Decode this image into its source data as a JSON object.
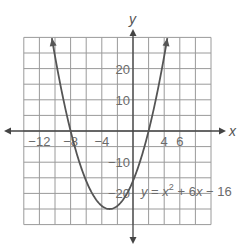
{
  "chart_data": {
    "type": "line",
    "title": "",
    "equation_label": "y = x^2 + 6x - 16",
    "equation_parts": {
      "y": "y",
      "eq": " = ",
      "x": "x",
      "exp": "2",
      "rest1": " + 6",
      "x2": "x",
      "rest2": " − 16"
    },
    "xlabel": "x",
    "ylabel": "y",
    "xlim": [
      -14,
      10
    ],
    "ylim": [
      -30,
      30
    ],
    "grid": true,
    "grid_step_x": 2,
    "grid_step_y": 5,
    "x_tick_labels": [
      {
        "value": -12,
        "text": "−12"
      },
      {
        "value": -8,
        "text": "−8"
      },
      {
        "value": -4,
        "text": "−4"
      },
      {
        "value": 4,
        "text": "4"
      },
      {
        "value": 6,
        "text": "6"
      }
    ],
    "y_tick_labels": [
      {
        "value": 20,
        "text": "20"
      },
      {
        "value": 10,
        "text": "10"
      },
      {
        "value": -10,
        "text": "−10"
      },
      {
        "value": -20,
        "text": "−20"
      }
    ],
    "series": [
      {
        "name": "y = x^2 + 6x - 16",
        "function": {
          "a": 1,
          "b": 6,
          "c": -16
        },
        "vertex": [
          -3,
          -25
        ],
        "roots": [
          -8,
          2
        ],
        "y_intercept": -16,
        "x": [
          -10.4,
          -10,
          -9,
          -8,
          -7,
          -6,
          -5,
          -4,
          -3,
          -2,
          -1,
          0,
          1,
          2,
          3,
          4,
          4.4
        ],
        "y": [
          29.8,
          24,
          11,
          0,
          -9,
          -16,
          -21,
          -24,
          -25,
          -24,
          -21,
          -16,
          -9,
          0,
          11,
          24,
          29.76
        ]
      }
    ],
    "colors": {
      "curve": "#555555",
      "grid": "#9a9a9a",
      "axis": "#444444",
      "text": "#6b6b6b"
    }
  }
}
